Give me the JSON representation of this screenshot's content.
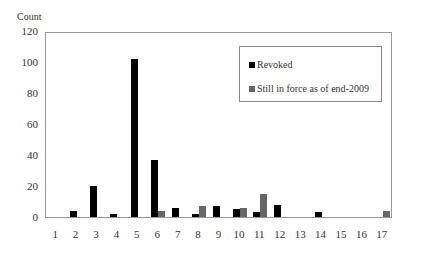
{
  "chart_data": {
    "type": "bar",
    "title": "",
    "xlabel": "",
    "ylabel": "Count",
    "ylim": [
      0,
      120
    ],
    "yticks": [
      0,
      20,
      40,
      60,
      80,
      100,
      120
    ],
    "categories": [
      "1",
      "2",
      "3",
      "4",
      "5",
      "6",
      "7",
      "8",
      "9",
      "10",
      "11",
      "12",
      "13",
      "14",
      "15",
      "16",
      "17"
    ],
    "series": [
      {
        "name": "Revoked",
        "color": "#000000",
        "values": [
          0,
          4,
          20,
          2,
          102,
          37,
          6,
          2,
          7,
          5,
          3,
          8,
          0,
          3,
          0,
          0,
          0
        ]
      },
      {
        "name": "Still in force as of end-2009",
        "color": "#666666",
        "values": [
          0,
          0,
          0,
          0,
          0,
          4,
          0,
          7,
          0,
          6,
          15,
          0,
          0,
          0,
          0,
          0,
          4
        ]
      }
    ],
    "grid": false,
    "legend_position": "upper right inside"
  },
  "labels": {
    "ylabel": "Count",
    "legend": [
      "Revoked",
      "Still in force as of end-2009"
    ]
  }
}
